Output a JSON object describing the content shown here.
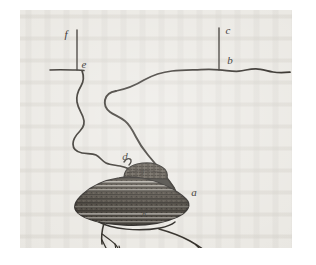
{
  "figure": {
    "medium": "engraving",
    "plate_background_color": "#ebe9e4",
    "page_background_color": "#ffffff",
    "ink_color": "#2b2824",
    "labels": [
      {
        "id": "label-f",
        "text": "f",
        "x": 46,
        "y": 28,
        "size": "normal",
        "refers_to": "upper-left leader line top"
      },
      {
        "id": "label-e",
        "text": "e",
        "x": 64,
        "y": 58,
        "size": "normal",
        "refers_to": "left soil-line junction"
      },
      {
        "id": "label-c",
        "text": "c",
        "x": 208,
        "y": 24,
        "size": "normal",
        "refers_to": "upper-right leader line top"
      },
      {
        "id": "label-b",
        "text": "b",
        "x": 210,
        "y": 54,
        "size": "normal",
        "refers_to": "right soil-line junction"
      },
      {
        "id": "label-d",
        "text": "d",
        "x": 105,
        "y": 150,
        "size": "normal",
        "refers_to": "left runner entering bulb"
      },
      {
        "id": "label-a",
        "text": "a",
        "x": 174,
        "y": 186,
        "size": "normal",
        "refers_to": "right flank of bulb"
      },
      {
        "id": "label-g",
        "text": "g",
        "x": 122,
        "y": 163,
        "size": "small",
        "refers_to": "bulb crown / neck"
      },
      {
        "id": "label-h",
        "text": "h",
        "x": 124,
        "y": 207,
        "size": "small",
        "refers_to": "bulb base plate"
      }
    ],
    "elements": {
      "left_leader_line": "vertical rule from f down to soil line at e",
      "right_leader_line": "vertical rule from c down to soil line at b",
      "left_soil_line": "short horizontal soil line at e",
      "right_soil_line": "long undulating soil line through b toward right edge",
      "left_runner": "sinuous runner descending from e to bulb at d",
      "right_runner": "sinuous runner descending from right soil line to bulb at a",
      "bulb": "dark hatched lens-shaped bulb with banded horizontal shading",
      "roots": "branching fibrous roots below the bulb"
    }
  }
}
